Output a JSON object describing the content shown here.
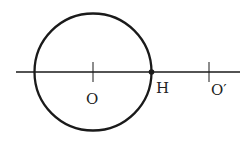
{
  "diagram": {
    "labels": {
      "center": "O",
      "tangent_point": "H",
      "other_center": "O′"
    },
    "colors": {
      "stroke": "#1a1a1a",
      "background": "#ffffff"
    }
  }
}
